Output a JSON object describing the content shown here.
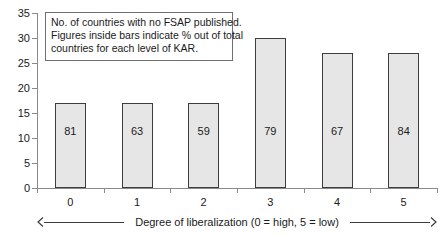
{
  "chart_data": {
    "type": "bar",
    "title": "",
    "xlabel": "Degree of liberalization (0 = high, 5 = low)",
    "ylabel": "",
    "categories": [
      "0",
      "1",
      "2",
      "3",
      "4",
      "5"
    ],
    "values": [
      17,
      17,
      17,
      30,
      27,
      27
    ],
    "bar_labels": [
      "81",
      "63",
      "59",
      "79",
      "67",
      "84"
    ],
    "bar_label_meaning": "% out of total countries for each level of KAR",
    "ylim": [
      0,
      35
    ],
    "yticks": [
      0,
      5,
      10,
      15,
      20,
      25,
      30,
      35
    ],
    "ytick_labels": [
      "0",
      "5",
      "10",
      "15",
      "20",
      "25",
      "30",
      "35"
    ],
    "grid": false,
    "legend": null,
    "annotations": [
      "No. of countries with no FSAP published.",
      "Figures inside bars indicate % out of total",
      "countries for each level of KAR."
    ],
    "colors": {
      "bar_fill": "#e6e6e6",
      "bar_border": "#3d3d3d",
      "axis": "#8a8a8a",
      "text": "#1a1a1a",
      "background": "#ffffff"
    }
  },
  "axis": {
    "x_caption": "Degree of liberalization (0 = high, 5 = low)",
    "left_arrow_icon": "arrow-left-icon",
    "right_arrow_icon": "arrow-right-icon"
  }
}
